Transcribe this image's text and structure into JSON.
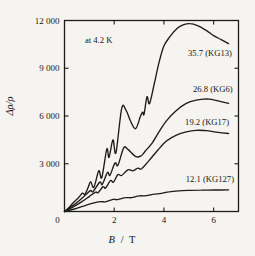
{
  "figure": {
    "background": "#f5f4f0",
    "line_color": "#1c1c1c",
    "text_color": "#161616"
  },
  "chart_data": {
    "type": "line",
    "title": "",
    "xlabel": "B / T",
    "xlabel_parts": {
      "variable": "B",
      "separator": "/",
      "unit": "T"
    },
    "ylabel": "Δρ/ρ",
    "xlim": [
      0,
      7
    ],
    "ylim": [
      0,
      12000
    ],
    "grid": false,
    "legend": "inline-labels",
    "x_ticks": [
      {
        "value": 0,
        "label": "0"
      },
      {
        "value": 2,
        "label": "2"
      },
      {
        "value": 4,
        "label": "4"
      },
      {
        "value": 6,
        "label": "6"
      }
    ],
    "y_ticks": [
      {
        "value": 0,
        "label": ""
      },
      {
        "value": 3000,
        "label": "3 000"
      },
      {
        "value": 6000,
        "label": "6 000"
      },
      {
        "value": 9000,
        "label": "9 000"
      },
      {
        "value": 12000,
        "label": "12 000"
      }
    ],
    "annotations": [
      {
        "name": "temperature-note",
        "text": "at 4.2 K",
        "x": 0.82,
        "y": 10580
      },
      {
        "name": "curve-label-kg13",
        "text": "35.7 (KG13)",
        "x": 4.97,
        "y": 9770
      },
      {
        "name": "curve-label-kg6",
        "text": "26.8 (KG6)",
        "x": 5.17,
        "y": 7500
      },
      {
        "name": "curve-label-kg17",
        "text": "19.2 (KG17)",
        "x": 4.85,
        "y": 5420
      },
      {
        "name": "curve-label-kg127",
        "text": "12.1 (KG127)",
        "x": 4.88,
        "y": 1850
      }
    ],
    "series": [
      {
        "name": "KG13",
        "label": "35.7 (KG13)",
        "mobility": 35.7,
        "points": [
          [
            0,
            0
          ],
          [
            0.15,
            200
          ],
          [
            0.35,
            550
          ],
          [
            0.55,
            850
          ],
          [
            0.72,
            1150
          ],
          [
            0.82,
            1080
          ],
          [
            0.95,
            1500
          ],
          [
            1.05,
            1880
          ],
          [
            1.18,
            1520
          ],
          [
            1.38,
            2560
          ],
          [
            1.5,
            2130
          ],
          [
            1.7,
            3920
          ],
          [
            1.79,
            3400
          ],
          [
            1.95,
            4500
          ],
          [
            2.07,
            3700
          ],
          [
            2.3,
            6480
          ],
          [
            2.48,
            6350
          ],
          [
            2.65,
            5700
          ],
          [
            2.86,
            5200
          ],
          [
            3.05,
            5950
          ],
          [
            3.14,
            6250
          ],
          [
            3.2,
            6100
          ],
          [
            3.32,
            7200
          ],
          [
            3.42,
            6780
          ],
          [
            3.6,
            7950
          ],
          [
            3.8,
            9350
          ],
          [
            4.0,
            10400
          ],
          [
            4.25,
            11000
          ],
          [
            4.55,
            11520
          ],
          [
            4.8,
            11740
          ],
          [
            5.05,
            11800
          ],
          [
            5.35,
            11680
          ],
          [
            5.7,
            11380
          ],
          [
            6.0,
            11050
          ],
          [
            6.3,
            10800
          ],
          [
            6.6,
            10550
          ]
        ]
      },
      {
        "name": "KG6",
        "label": "26.8 (KG6)",
        "mobility": 26.8,
        "points": [
          [
            0,
            0
          ],
          [
            0.3,
            320
          ],
          [
            0.6,
            700
          ],
          [
            0.9,
            1120
          ],
          [
            1.05,
            1320
          ],
          [
            1.15,
            1260
          ],
          [
            1.42,
            1850
          ],
          [
            1.52,
            1700
          ],
          [
            1.73,
            2450
          ],
          [
            1.83,
            2280
          ],
          [
            2.03,
            3050
          ],
          [
            2.15,
            2900
          ],
          [
            2.38,
            4000
          ],
          [
            2.55,
            3900
          ],
          [
            2.88,
            3440
          ],
          [
            3.1,
            3520
          ],
          [
            3.25,
            3800
          ],
          [
            3.5,
            4250
          ],
          [
            3.8,
            5000
          ],
          [
            4.1,
            5700
          ],
          [
            4.5,
            6350
          ],
          [
            4.9,
            6800
          ],
          [
            5.3,
            7000
          ],
          [
            5.7,
            7080
          ],
          [
            6.0,
            7020
          ],
          [
            6.3,
            6900
          ],
          [
            6.6,
            6800
          ]
        ]
      },
      {
        "name": "KG17",
        "label": "19.2 (KG17)",
        "mobility": 19.2,
        "points": [
          [
            0,
            0
          ],
          [
            0.35,
            280
          ],
          [
            0.7,
            620
          ],
          [
            1.0,
            950
          ],
          [
            1.25,
            1220
          ],
          [
            1.35,
            1180
          ],
          [
            1.55,
            1560
          ],
          [
            1.65,
            1470
          ],
          [
            1.85,
            1950
          ],
          [
            1.97,
            1850
          ],
          [
            2.15,
            2320
          ],
          [
            2.3,
            2260
          ],
          [
            2.55,
            2620
          ],
          [
            2.75,
            2560
          ],
          [
            2.95,
            2720
          ],
          [
            3.1,
            2690
          ],
          [
            3.4,
            3200
          ],
          [
            3.75,
            3850
          ],
          [
            4.1,
            4420
          ],
          [
            4.5,
            4800
          ],
          [
            4.9,
            5000
          ],
          [
            5.3,
            5100
          ],
          [
            5.7,
            5080
          ],
          [
            6.1,
            4990
          ],
          [
            6.6,
            4900
          ]
        ]
      },
      {
        "name": "KG127",
        "label": "12.1 (KG127)",
        "mobility": 12.1,
        "points": [
          [
            0,
            0
          ],
          [
            0.4,
            160
          ],
          [
            0.8,
            360
          ],
          [
            1.15,
            520
          ],
          [
            1.45,
            620
          ],
          [
            1.65,
            610
          ],
          [
            1.95,
            760
          ],
          [
            2.15,
            750
          ],
          [
            2.45,
            870
          ],
          [
            2.7,
            865
          ],
          [
            3.0,
            980
          ],
          [
            3.3,
            990
          ],
          [
            3.6,
            1090
          ],
          [
            3.9,
            1140
          ],
          [
            4.2,
            1240
          ],
          [
            4.6,
            1300
          ],
          [
            5.0,
            1330
          ],
          [
            5.5,
            1345
          ],
          [
            6.0,
            1350
          ],
          [
            6.6,
            1360
          ]
        ]
      }
    ]
  }
}
